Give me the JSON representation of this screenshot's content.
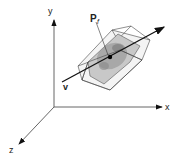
{
  "diagram": {
    "axes": {
      "x_label": "x",
      "y_label": "y",
      "z_label": "z"
    },
    "point_label": "P",
    "point_subscript": "f",
    "vector_label": "v",
    "colors": {
      "line": "#111111",
      "axis": "#555555",
      "box_fill": "#c8c8c8",
      "object_fill": "#9a9a9a"
    }
  }
}
